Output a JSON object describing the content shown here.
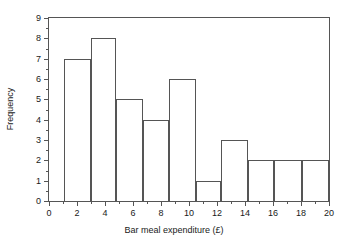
{
  "chart_data": {
    "type": "bar",
    "title": "",
    "xlabel": "Bar meal expenditure (£)",
    "ylabel": "Frequency",
    "xlim": [
      0,
      20
    ],
    "ylim": [
      0,
      9
    ],
    "grid": false,
    "legend": null,
    "xticks": [
      0,
      2,
      4,
      6,
      8,
      10,
      12,
      14,
      16,
      18,
      20
    ],
    "xtick_labels": [
      "0",
      "2",
      "4",
      "6",
      "8",
      "10",
      "12",
      "14",
      "16",
      "18",
      "20"
    ],
    "yticks": [
      0,
      1,
      2,
      3,
      4,
      5,
      6,
      7,
      8,
      9
    ],
    "ytick_labels": [
      "0",
      "1",
      "2",
      "3",
      "4",
      "5",
      "6",
      "7",
      "8",
      "9"
    ],
    "bin_edges": [
      1.1,
      3.0,
      4.8,
      6.7,
      8.6,
      10.5,
      12.3,
      14.2,
      16.1,
      18.1,
      20.0
    ],
    "categories": [
      "1.1-3.0",
      "3.0-4.8",
      "4.8-6.7",
      "6.7-8.6",
      "8.6-10.5",
      "10.5-12.3",
      "12.3-14.2",
      "14.2-16.1",
      "16.1-18.1",
      "18.1-20.0"
    ],
    "values": [
      7,
      8,
      5,
      4,
      6,
      1,
      3,
      2,
      2,
      2
    ],
    "bar_color": "#ffffff",
    "bar_edge_color": "#555555",
    "axis_color": "#555555",
    "text_color": "#1a1a1a",
    "background": "#ffffff"
  }
}
